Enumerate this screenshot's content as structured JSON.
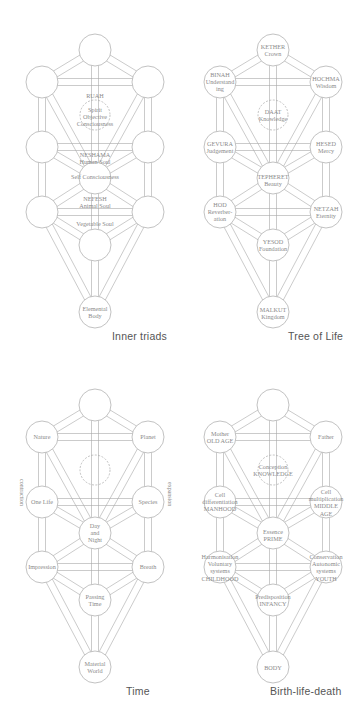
{
  "style": {
    "stroke_color": "#a8a8a8",
    "text_color": "#8a8a8a",
    "caption_color": "#555555",
    "background": "#ffffff"
  },
  "geometry": {
    "node_radius": 16,
    "channel_half_width": 3.5,
    "nodes": {
      "kether": [
        95,
        50
      ],
      "binah": [
        42,
        82
      ],
      "hochma": [
        148,
        82
      ],
      "daat": [
        95,
        115
      ],
      "gevura": [
        42,
        147
      ],
      "hesed": [
        148,
        147
      ],
      "tiferet": [
        95,
        178
      ],
      "hod": [
        42,
        212
      ],
      "netzah": [
        148,
        212
      ],
      "yesod": [
        95,
        245
      ],
      "malkut": [
        95,
        312
      ]
    },
    "paths": [
      [
        "kether",
        "binah"
      ],
      [
        "kether",
        "hochma"
      ],
      [
        "kether",
        "tiferet"
      ],
      [
        "binah",
        "hochma"
      ],
      [
        "binah",
        "gevura"
      ],
      [
        "binah",
        "tiferet"
      ],
      [
        "hochma",
        "hesed"
      ],
      [
        "hochma",
        "tiferet"
      ],
      [
        "gevura",
        "hesed"
      ],
      [
        "gevura",
        "tiferet"
      ],
      [
        "hesed",
        "tiferet"
      ],
      [
        "gevura",
        "hod"
      ],
      [
        "hesed",
        "netzah"
      ],
      [
        "tiferet",
        "hod"
      ],
      [
        "tiferet",
        "netzah"
      ],
      [
        "tiferet",
        "yesod"
      ],
      [
        "hod",
        "netzah"
      ],
      [
        "hod",
        "yesod"
      ],
      [
        "netzah",
        "yesod"
      ],
      [
        "hod",
        "malkut"
      ],
      [
        "netzah",
        "malkut"
      ],
      [
        "yesod",
        "malkut"
      ]
    ]
  },
  "panels": [
    {
      "id": "inner-triads",
      "caption": "Inner triads",
      "offset": [
        0,
        0
      ],
      "caption_pos": [
        112,
        330
      ],
      "labels": [
        {
          "at": [
            95,
            96
          ],
          "lines": [
            "RUAH"
          ]
        },
        {
          "at": [
            95,
            117
          ],
          "lines": [
            "Spirit",
            "Objective",
            "Consciousness"
          ]
        },
        {
          "at": [
            95,
            158
          ],
          "lines": [
            "NESHAMA",
            "Human Soul"
          ]
        },
        {
          "at": [
            95,
            177
          ],
          "lines": [
            "Self Consciousness"
          ]
        },
        {
          "at": [
            95,
            202
          ],
          "lines": [
            "NEFESH",
            "Animal Soul"
          ]
        },
        {
          "at": [
            95,
            224
          ],
          "lines": [
            "Vegetable Soul"
          ]
        },
        {
          "at": [
            95,
            312
          ],
          "lines": [
            "Elemental",
            "Body"
          ]
        }
      ],
      "hidden_node_bg": [
        "daat_label_only"
      ]
    },
    {
      "id": "tree-of-life",
      "caption": "Tree of Life",
      "offset": [
        178,
        0
      ],
      "caption_pos": [
        110,
        330
      ],
      "labels": [
        {
          "at": [
            95,
            50
          ],
          "lines": [
            "KETHER",
            "Crown"
          ]
        },
        {
          "at": [
            42,
            82
          ],
          "lines": [
            "BINAH",
            "Understand",
            "ing"
          ]
        },
        {
          "at": [
            148,
            82
          ],
          "lines": [
            "HOCHMA",
            "Wisdom"
          ]
        },
        {
          "at": [
            95,
            115
          ],
          "lines": [
            "DAAT",
            "Knowledge"
          ]
        },
        {
          "at": [
            42,
            147
          ],
          "lines": [
            "GEVURA",
            "Judgement"
          ]
        },
        {
          "at": [
            148,
            147
          ],
          "lines": [
            "HESED",
            "Mercy"
          ]
        },
        {
          "at": [
            95,
            180
          ],
          "lines": [
            "TEPHERET",
            "Beauty"
          ]
        },
        {
          "at": [
            42,
            212
          ],
          "lines": [
            "HOD",
            "Reverber-",
            "ation"
          ]
        },
        {
          "at": [
            148,
            212
          ],
          "lines": [
            "NETZAH",
            "Eternity"
          ]
        },
        {
          "at": [
            95,
            245
          ],
          "lines": [
            "YESOD",
            "Foundation"
          ]
        },
        {
          "at": [
            95,
            313
          ],
          "lines": [
            "MALKUT",
            "Kingdom"
          ]
        }
      ]
    },
    {
      "id": "time",
      "caption": "Time",
      "offset": [
        0,
        355
      ],
      "caption_pos": [
        126,
        330
      ],
      "side_labels": {
        "left": "contraction",
        "right": "expansion"
      },
      "labels": [
        {
          "at": [
            42,
            82
          ],
          "lines": [
            "Nature"
          ]
        },
        {
          "at": [
            148,
            82
          ],
          "lines": [
            "Planet"
          ]
        },
        {
          "at": [
            42,
            147
          ],
          "lines": [
            "One Life"
          ]
        },
        {
          "at": [
            148,
            147
          ],
          "lines": [
            "Species"
          ]
        },
        {
          "at": [
            95,
            178
          ],
          "lines": [
            "Day",
            "and",
            "Night"
          ]
        },
        {
          "at": [
            42,
            212
          ],
          "lines": [
            "Impression"
          ]
        },
        {
          "at": [
            148,
            212
          ],
          "lines": [
            "Breath"
          ]
        },
        {
          "at": [
            95,
            245
          ],
          "lines": [
            "Passing",
            "Time"
          ]
        },
        {
          "at": [
            95,
            312
          ],
          "lines": [
            "Material",
            "World"
          ]
        }
      ]
    },
    {
      "id": "birth-life-death",
      "caption": "Birth-life-death",
      "offset": [
        178,
        355
      ],
      "caption_pos": [
        92,
        330
      ],
      "labels": [
        {
          "at": [
            42,
            82
          ],
          "lines": [
            "Mother",
            "OLD AGE"
          ]
        },
        {
          "at": [
            148,
            82
          ],
          "lines": [
            "Father"
          ]
        },
        {
          "at": [
            95,
            115
          ],
          "lines": [
            "Conception",
            "KNOWLEDGE"
          ]
        },
        {
          "at": [
            42,
            147
          ],
          "lines": [
            "Cell",
            "differentiation",
            "MANHOOD"
          ]
        },
        {
          "at": [
            148,
            147
          ],
          "lines": [
            "Cell",
            "multiplication",
            "MIDDLE",
            "AGE"
          ]
        },
        {
          "at": [
            95,
            180
          ],
          "lines": [
            "Essence",
            "PRIME"
          ]
        },
        {
          "at": [
            42,
            212
          ],
          "lines": [
            "Harmonisation",
            "Voluntary",
            "systems",
            "CHILDHOOD"
          ]
        },
        {
          "at": [
            148,
            212
          ],
          "lines": [
            "Conservation",
            "Autonomic",
            "systems",
            "YOUTH"
          ]
        },
        {
          "at": [
            95,
            245
          ],
          "lines": [
            "Predisposition",
            "INFANCY"
          ]
        },
        {
          "at": [
            95,
            313
          ],
          "lines": [
            "BODY"
          ]
        }
      ]
    }
  ]
}
